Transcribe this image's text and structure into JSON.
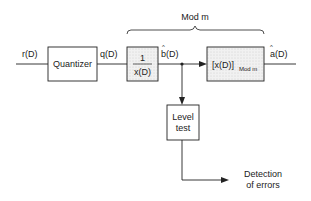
{
  "diagram": {
    "brace_label": "Mod m",
    "signals": {
      "input": "r(D)",
      "quantized": "q(D)",
      "b_hat": "b(D)",
      "a_hat": "a(D)",
      "hat_mark": "^"
    },
    "blocks": {
      "quantizer": "Quantizer",
      "inverse_numerator": "1",
      "inverse_denominator": "x(D)",
      "mod_main": "[x(D)]",
      "mod_sub": "Mod m",
      "level_test_line1": "Level",
      "level_test_line2": "test"
    },
    "output": {
      "line1": "Detection",
      "line2": "of errors"
    },
    "colors": {
      "line": "#222222",
      "shaded_fill": "#ececec",
      "box_fill": "#ffffff"
    }
  }
}
